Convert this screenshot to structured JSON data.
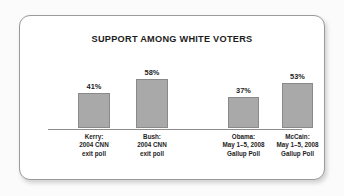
{
  "chart_data": {
    "type": "bar",
    "title": "SUPPORT AMONG WHITE VOTERS",
    "xlabel": "",
    "ylabel": "",
    "ylim": [
      0,
      60
    ],
    "grid": false,
    "legend": "none",
    "categories": [
      "Kerry: 2004 CNN exit poll",
      "Bush: 2004 CNN exit poll",
      "Obama: May 1–5, 2008 Gallup Poll",
      "McCain: May 1–5, 2008 Gallup Poll"
    ],
    "values": [
      41,
      58,
      37,
      53
    ],
    "value_labels": [
      "41%",
      "58%",
      "37%",
      "53%"
    ],
    "bars": [
      {
        "value": 41,
        "value_label": "41%",
        "caption_line1": "Kerry:",
        "caption_line2": "2004 CNN",
        "caption_line3": "exit poll",
        "left": 58,
        "width": 32
      },
      {
        "value": 58,
        "value_label": "58%",
        "caption_line1": "Bush:",
        "caption_line2": "2004 CNN",
        "caption_line3": "exit poll",
        "left": 116,
        "width": 32
      },
      {
        "value": 37,
        "value_label": "37%",
        "caption_line1": "Obama:",
        "caption_line2": "May 1–5, 2008",
        "caption_line3": "Gallup Poll",
        "left": 208,
        "width": 31
      },
      {
        "value": 53,
        "value_label": "53%",
        "caption_line1": "McCain:",
        "caption_line2": "May 1–5, 2008",
        "caption_line3": "Gallup Poll",
        "left": 262,
        "width": 31
      }
    ]
  },
  "colors": {
    "bar_fill": "#a9a9a9",
    "bar_border": "#8a8a8a",
    "axis": "#8d8d8d",
    "text": "#1d1d1d",
    "card_border": "#9a9a9a",
    "card_background": "#ffffff",
    "page_background": "#fbfbfb"
  }
}
